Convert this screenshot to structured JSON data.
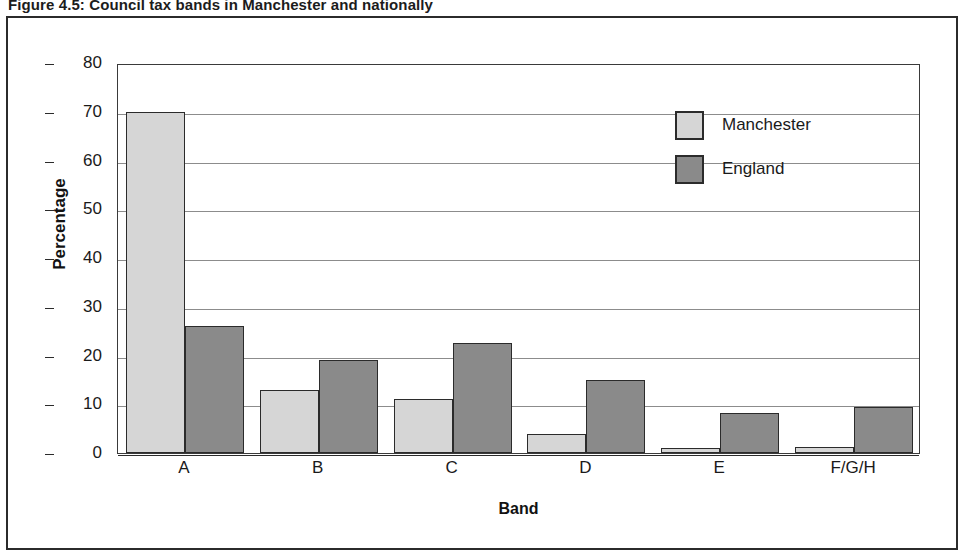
{
  "figure": {
    "caption": "Figure 4.5: Council tax bands in Manchester and nationally"
  },
  "chart_data": {
    "type": "bar",
    "title": "Figure 4.5: Council tax bands in Manchester and nationally",
    "xlabel": "Band",
    "ylabel": "Percentage",
    "categories": [
      "A",
      "B",
      "C",
      "D",
      "E",
      "F/G/H"
    ],
    "series": [
      {
        "name": "Manchester",
        "color": "#d6d6d6",
        "values": [
          70,
          13,
          11,
          4,
          1,
          1.2
        ]
      },
      {
        "name": "England",
        "color": "#8a8a8a",
        "values": [
          26,
          19,
          22.5,
          15,
          8.3,
          9.4
        ]
      }
    ],
    "ylim": [
      0,
      80
    ],
    "ytick_labels": [
      "80",
      "70",
      "60",
      "50",
      "40",
      "30",
      "20",
      "10",
      "0"
    ],
    "ytick_values": [
      80,
      70,
      60,
      50,
      40,
      30,
      20,
      10,
      0
    ],
    "grid": true,
    "legend_position": "top-right"
  }
}
